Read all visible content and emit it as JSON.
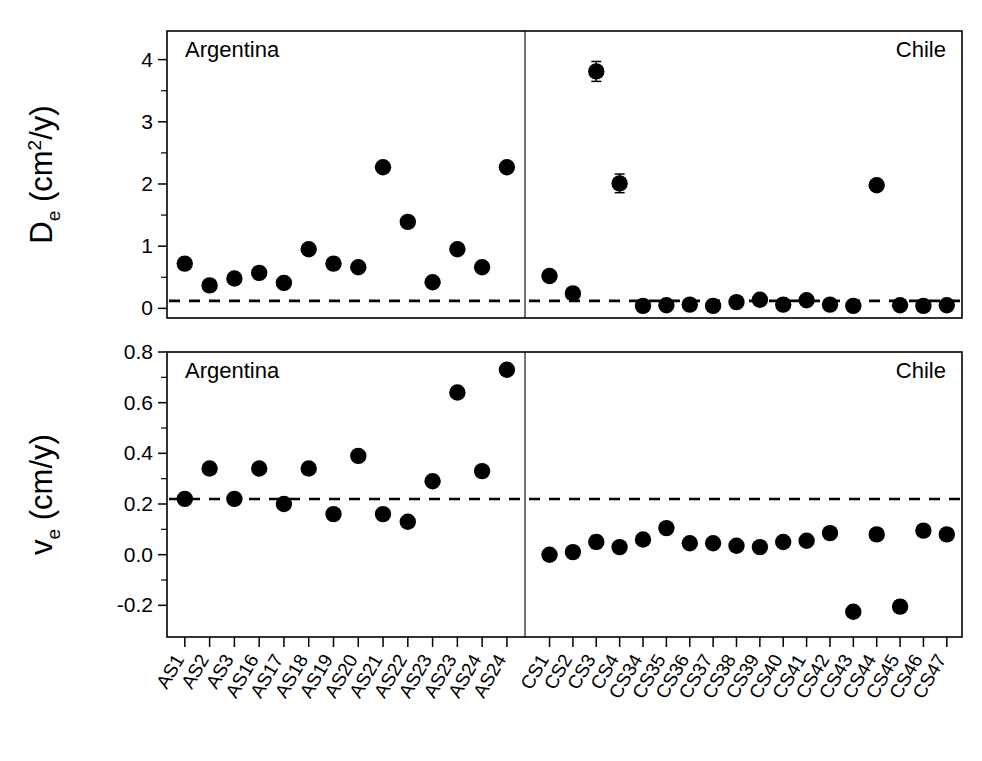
{
  "figure": {
    "width": 982,
    "height": 761,
    "background": "#ffffff",
    "marker_color": "#000000",
    "reference_line_style": "dashed"
  },
  "chart_data": [
    {
      "type": "scatter",
      "id": "top-panel",
      "title": "",
      "ylabel": "D_e (cm2/y)",
      "ylabel_parts": {
        "symbol": "D",
        "subscript": "e",
        "unit_prefix": " (cm",
        "superscript": "2",
        "unit_suffix": "/y)"
      },
      "xlabel": "",
      "ylim": [
        -0.15,
        4.5
      ],
      "yticks": [
        0,
        1,
        2,
        3,
        4
      ],
      "ytick_labels": [
        "0",
        "1",
        "2",
        "3",
        "4"
      ],
      "yminor_ticks": [
        0.5,
        1.5,
        2.5,
        3.5
      ],
      "grid": false,
      "legend": "none",
      "reference_line_y": 0.12,
      "groups": [
        {
          "name": "Argentina",
          "annotation": "Argentina",
          "annotation_position": "top-left",
          "categories": [
            "AS1",
            "AS2",
            "AS3",
            "AS16",
            "AS17",
            "AS18",
            "AS19",
            "AS20",
            "AS21",
            "AS22",
            "AS23",
            "AS23",
            "AS24",
            "AS24"
          ],
          "values": [
            0.72,
            0.37,
            0.48,
            0.57,
            0.41,
            0.95,
            0.72,
            0.66,
            2.27,
            1.39,
            0.42,
            0.95,
            0.66,
            2.27
          ],
          "errors": [
            0,
            0,
            0,
            0,
            0,
            0,
            0,
            0,
            0,
            0,
            0,
            0,
            0,
            0
          ]
        },
        {
          "name": "Chile",
          "annotation": "Chile",
          "annotation_position": "top-right",
          "categories": [
            "CS1",
            "CS2",
            "CS3",
            "CS4",
            "CS34",
            "CS35",
            "CS36",
            "CS37",
            "CS38",
            "CS39",
            "CS40",
            "CS41",
            "CS42",
            "CS43",
            "CS44",
            "CS45",
            "CS46",
            "CS47"
          ],
          "values": [
            0.52,
            0.24,
            3.81,
            2.01,
            0.04,
            0.05,
            0.06,
            0.04,
            0.1,
            0.14,
            0.06,
            0.13,
            0.06,
            0.04,
            1.98,
            0.05,
            0.04,
            0.05
          ],
          "errors": [
            0,
            0,
            0.16,
            0.15,
            0,
            0,
            0,
            0,
            0,
            0,
            0,
            0,
            0,
            0,
            0,
            0,
            0,
            0
          ]
        }
      ]
    },
    {
      "type": "scatter",
      "id": "bottom-panel",
      "title": "",
      "ylabel": "v_e (cm/y)",
      "ylabel_parts": {
        "symbol": "v",
        "subscript": "e",
        "unit_prefix": " (cm",
        "superscript": "",
        "unit_suffix": "/y)"
      },
      "xlabel": "",
      "ylim": [
        -0.32,
        0.8
      ],
      "yticks": [
        -0.2,
        0.0,
        0.2,
        0.4,
        0.6,
        0.8
      ],
      "ytick_labels": [
        "-0.2",
        "0.0",
        "0.2",
        "0.4",
        "0.6",
        "0.8"
      ],
      "yminor_ticks": [
        -0.1,
        0.1,
        0.3,
        0.5,
        0.7
      ],
      "grid": false,
      "legend": "none",
      "reference_line_y": 0.22,
      "groups": [
        {
          "name": "Argentina",
          "annotation": "Argentina",
          "annotation_position": "top-left",
          "categories": [
            "AS1",
            "AS2",
            "AS3",
            "AS16",
            "AS17",
            "AS18",
            "AS19",
            "AS20",
            "AS21",
            "AS22",
            "AS23",
            "AS23",
            "AS24",
            "AS24"
          ],
          "values": [
            0.22,
            0.34,
            0.22,
            0.34,
            0.2,
            0.34,
            0.16,
            0.39,
            0.16,
            0.13,
            0.29,
            0.64,
            0.33,
            0.73
          ],
          "errors": [
            0,
            0,
            0,
            0,
            0,
            0,
            0,
            0,
            0,
            0,
            0,
            0,
            0,
            0
          ]
        },
        {
          "name": "Chile",
          "annotation": "Chile",
          "annotation_position": "top-right",
          "categories": [
            "CS1",
            "CS2",
            "CS3",
            "CS4",
            "CS34",
            "CS35",
            "CS36",
            "CS37",
            "CS38",
            "CS39",
            "CS40",
            "CS41",
            "CS42",
            "CS43",
            "CS44",
            "CS45",
            "CS46",
            "CS47"
          ],
          "values": [
            0.0,
            0.01,
            0.05,
            0.03,
            0.06,
            0.105,
            0.045,
            0.045,
            0.035,
            0.03,
            0.05,
            0.055,
            0.085,
            -0.225,
            0.08,
            -0.205,
            0.095,
            0.08
          ],
          "errors": [
            0,
            0,
            0.025,
            0.02,
            0,
            0,
            0,
            0,
            0,
            0,
            0,
            0,
            0,
            0,
            0,
            0,
            0,
            0
          ]
        }
      ]
    }
  ],
  "x_axis": {
    "argentina_labels": [
      "AS1",
      "AS2",
      "AS3",
      "AS16",
      "AS17",
      "AS18",
      "AS19",
      "AS20",
      "AS21",
      "AS22",
      "AS23",
      "AS23",
      "AS24",
      "AS24"
    ],
    "chile_labels": [
      "CS1",
      "CS2",
      "CS3",
      "CS4",
      "CS34",
      "CS35",
      "CS36",
      "CS37",
      "CS38",
      "CS39",
      "CS40",
      "CS41",
      "CS42",
      "CS43",
      "CS44",
      "CS45",
      "CS46",
      "CS47"
    ],
    "label_rotation": "-60"
  },
  "annotations": {
    "top_left": "Argentina",
    "top_right": "Chile",
    "bottom_left": "Argentina",
    "bottom_right": "Chile"
  }
}
